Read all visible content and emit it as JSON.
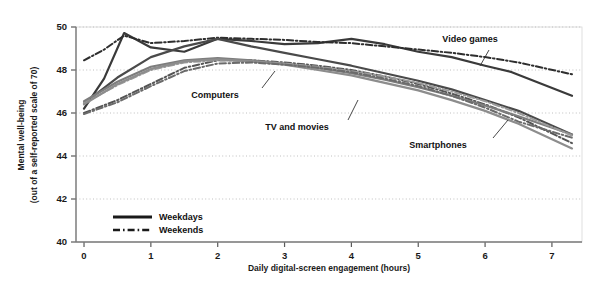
{
  "chart_data": {
    "type": "line",
    "title": "",
    "xlabel": "Daily digital-screen engagement (hours)",
    "ylabel": "Mental well-being\n(out of a self-reported scale of 70)",
    "ylabel_line1": "Mental well-being",
    "ylabel_line2": "(out of a self-reported scale of 70)",
    "xlim": [
      -0.12,
      7.45
    ],
    "ylim": [
      40,
      50
    ],
    "xticks": [
      0,
      1,
      2,
      3,
      4,
      5,
      6,
      7
    ],
    "yticks": [
      40,
      42,
      44,
      46,
      48,
      50
    ],
    "xticklabels": [
      "0",
      "1",
      "2",
      "3",
      "4",
      "5",
      "6",
      "7"
    ],
    "yticklabels": [
      "40",
      "42",
      "44",
      "46",
      "48",
      "50"
    ],
    "grid": "horizontal-dotted",
    "legend_position": "bottom-left-inside",
    "legend": [
      {
        "label": "Weekdays",
        "style": "solid"
      },
      {
        "label": "Weekends",
        "style": "dash-dot"
      }
    ],
    "annotations": [
      {
        "label": "Video games",
        "x": 470,
        "y": 42
      },
      {
        "label": "Computers",
        "x": 215,
        "y": 98
      },
      {
        "label": "TV and movies",
        "x": 297,
        "y": 130
      },
      {
        "label": "Smartphones",
        "x": 438,
        "y": 148
      }
    ],
    "series": [
      {
        "name": "Video games",
        "day": "Weekdays",
        "style": "solid",
        "color": "#3a3a3a",
        "width": 2.2,
        "x": [
          0.0,
          0.3,
          0.6,
          1.0,
          1.5,
          2.0,
          2.5,
          3.0,
          3.5,
          4.0,
          4.5,
          5.0,
          5.5,
          6.0,
          6.4,
          7.3
        ],
        "y": [
          46.2,
          47.6,
          49.72,
          49.05,
          48.85,
          49.45,
          49.35,
          49.2,
          49.25,
          49.45,
          49.2,
          48.85,
          48.6,
          48.2,
          47.9,
          46.8
        ]
      },
      {
        "name": "Video games",
        "day": "Weekends",
        "style": "dash-dot",
        "color": "#2e2e2e",
        "width": 2.0,
        "x": [
          0.0,
          0.3,
          0.6,
          1.0,
          1.5,
          2.0,
          2.5,
          3.0,
          3.5,
          4.0,
          4.5,
          5.0,
          5.5,
          6.0,
          6.5,
          7.3
        ],
        "y": [
          48.45,
          48.95,
          49.6,
          49.25,
          49.35,
          49.5,
          49.45,
          49.4,
          49.3,
          49.25,
          49.1,
          48.95,
          48.8,
          48.6,
          48.35,
          47.8
        ]
      },
      {
        "name": "Computers",
        "day": "Weekdays",
        "style": "solid",
        "color": "#4a4a4a",
        "width": 2.2,
        "x": [
          0.0,
          0.5,
          1.0,
          1.5,
          2.0,
          2.5,
          3.0,
          3.5,
          4.0,
          4.5,
          5.0,
          5.5,
          6.0,
          6.5,
          7.3
        ],
        "y": [
          46.45,
          47.65,
          48.6,
          49.1,
          49.45,
          49.1,
          48.8,
          48.5,
          48.2,
          47.85,
          47.5,
          47.1,
          46.6,
          46.1,
          45.0
        ]
      },
      {
        "name": "Computers",
        "day": "Weekends",
        "style": "dash-dot",
        "color": "#555555",
        "width": 2.0,
        "x": [
          0.0,
          0.5,
          1.0,
          1.5,
          2.0,
          2.5,
          3.0,
          3.5,
          4.0,
          4.5,
          5.0,
          5.5,
          6.0,
          6.5,
          7.3
        ],
        "y": [
          46.0,
          46.6,
          47.35,
          48.1,
          48.45,
          48.45,
          48.35,
          48.2,
          48.0,
          47.7,
          47.35,
          46.9,
          46.4,
          45.8,
          44.6
        ]
      },
      {
        "name": "TV and movies",
        "day": "Weekdays",
        "style": "solid",
        "color": "#7d7d7d",
        "width": 2.2,
        "x": [
          0.0,
          0.5,
          1.0,
          1.5,
          2.0,
          2.5,
          3.0,
          3.5,
          4.0,
          4.5,
          5.0,
          5.5,
          6.0,
          6.5,
          7.3
        ],
        "y": [
          46.55,
          47.45,
          48.15,
          48.45,
          48.55,
          48.45,
          48.3,
          48.1,
          47.85,
          47.55,
          47.2,
          46.8,
          46.35,
          45.85,
          45.0
        ]
      },
      {
        "name": "TV and movies",
        "day": "Weekends",
        "style": "dash-dot",
        "color": "#9a9a9a",
        "width": 2.0,
        "x": [
          0.0,
          0.5,
          1.0,
          1.5,
          2.0,
          2.5,
          3.0,
          3.5,
          4.0,
          4.5,
          5.0,
          5.5,
          6.0,
          6.5,
          7.3
        ],
        "y": [
          46.45,
          47.3,
          48.0,
          48.35,
          48.45,
          48.4,
          48.3,
          48.15,
          47.95,
          47.7,
          47.4,
          47.0,
          46.55,
          46.0,
          44.95
        ]
      },
      {
        "name": "Smartphones",
        "day": "Weekdays",
        "style": "solid",
        "color": "#8d8d8d",
        "width": 2.2,
        "x": [
          0.0,
          0.5,
          1.0,
          1.5,
          2.0,
          2.5,
          3.0,
          3.5,
          4.0,
          4.5,
          5.0,
          5.5,
          6.0,
          6.5,
          7.3
        ],
        "y": [
          46.4,
          47.35,
          48.05,
          48.4,
          48.5,
          48.4,
          48.25,
          48.0,
          47.75,
          47.4,
          47.05,
          46.6,
          46.1,
          45.5,
          44.35
        ]
      },
      {
        "name": "Smartphones",
        "day": "Weekends",
        "style": "dash-dot",
        "color": "#6b6b6b",
        "width": 2.0,
        "x": [
          0.0,
          0.5,
          1.0,
          1.5,
          2.0,
          2.5,
          3.0,
          3.5,
          4.0,
          4.5,
          5.0,
          5.5,
          6.0,
          6.5,
          7.3
        ],
        "y": [
          45.95,
          46.5,
          47.25,
          47.95,
          48.3,
          48.35,
          48.25,
          48.1,
          47.9,
          47.6,
          47.25,
          46.8,
          46.25,
          45.6,
          44.85
        ]
      }
    ]
  },
  "colors": {
    "axis": "#7a7a7a",
    "grid": "#b9b9b9",
    "text": "#111111",
    "plot_background": "#ffffff"
  }
}
